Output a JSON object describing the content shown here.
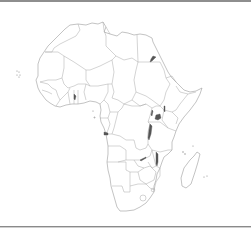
{
  "map": {
    "subject": "Africa political outline map",
    "style": "blank outline, country borders only, no labels",
    "colors": {
      "land_fill": "#ffffff",
      "coastline": "#9a9a9a",
      "borders": "#a8a8a8",
      "lakes": "#555555",
      "frame_rule": "#8e8e8e",
      "background": "#ffffff"
    },
    "features": [
      "coastline",
      "country-borders",
      "lakes",
      "madagascar",
      "cape-verde-islands",
      "comoros",
      "seychelles",
      "sao-tome"
    ]
  }
}
